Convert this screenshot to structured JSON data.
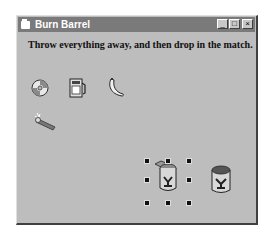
{
  "window": {
    "title": "Burn Barrel",
    "buttons": {
      "minimize": "_",
      "maximize": "□",
      "close": "×"
    }
  },
  "form": {
    "instruction": "Throw everything away, and then drop in the match.",
    "items": [
      {
        "name": "cd-disc",
        "icon": "cd-icon"
      },
      {
        "name": "gas-pump",
        "icon": "gas-pump-icon"
      },
      {
        "name": "banana",
        "icon": "banana-icon"
      },
      {
        "name": "match",
        "icon": "match-icon"
      },
      {
        "name": "barrel-open",
        "icon": "barrel-open-icon",
        "selected": true
      },
      {
        "name": "barrel-closed",
        "icon": "barrel-closed-icon"
      }
    ]
  }
}
